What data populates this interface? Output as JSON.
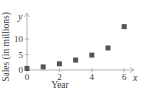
{
  "chart_data": {
    "type": "scatter",
    "title": "",
    "xlabel": "Year",
    "ylabel": "Sales (in millions)",
    "x_axis_var": "x",
    "y_axis_var": "y",
    "x": [
      0,
      1,
      2,
      3,
      4,
      5,
      6
    ],
    "series": [
      {
        "name": "Sales",
        "values": [
          0.5,
          1,
          2,
          3.2,
          4.8,
          7.1,
          14
        ]
      }
    ],
    "x_ticks": [
      "0",
      "2",
      "4",
      "6"
    ],
    "y_ticks": [
      "0",
      "5",
      "10"
    ],
    "xlim": [
      0,
      7
    ],
    "ylim": [
      0,
      17
    ],
    "grid": false,
    "legend": false,
    "marker": "square",
    "marker_color": "#555555"
  }
}
